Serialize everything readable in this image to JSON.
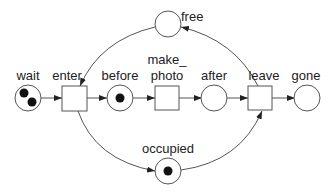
{
  "diagram": {
    "type": "petri-net",
    "colors": {
      "stroke": "#555555",
      "token": "#111111",
      "text": "#222222",
      "background": "#ffffff"
    },
    "places": [
      {
        "id": "wait",
        "label": "wait",
        "tokens": 2
      },
      {
        "id": "before",
        "label": "before",
        "tokens": 1
      },
      {
        "id": "after",
        "label": "after",
        "tokens": 0
      },
      {
        "id": "gone",
        "label": "gone",
        "tokens": 0
      },
      {
        "id": "free",
        "label": "free",
        "tokens": 0
      },
      {
        "id": "occupied",
        "label": "occupied",
        "tokens": 1
      }
    ],
    "transitions": [
      {
        "id": "enter",
        "label": "enter"
      },
      {
        "id": "make_photo",
        "label_line1": "make_",
        "label_line2": "photo"
      },
      {
        "id": "leave",
        "label": "leave"
      }
    ],
    "arcs": [
      {
        "from": "wait",
        "to": "enter"
      },
      {
        "from": "enter",
        "to": "before"
      },
      {
        "from": "before",
        "to": "make_photo"
      },
      {
        "from": "make_photo",
        "to": "after"
      },
      {
        "from": "after",
        "to": "leave"
      },
      {
        "from": "leave",
        "to": "gone"
      },
      {
        "from": "free",
        "to": "enter"
      },
      {
        "from": "enter",
        "to": "occupied"
      },
      {
        "from": "occupied",
        "to": "leave"
      },
      {
        "from": "leave",
        "to": "free"
      }
    ]
  }
}
